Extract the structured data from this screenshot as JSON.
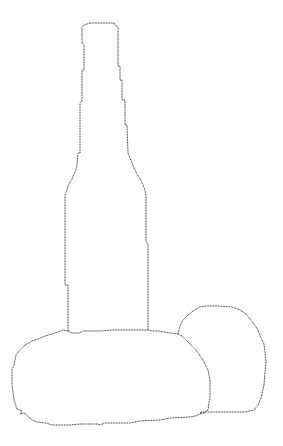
{
  "drawing": {
    "description": "Line drawing of a bottle standing behind a rounded loaf shape with a ball to its right",
    "objects": [
      "bottle",
      "oval-loaf",
      "ball"
    ],
    "stroke_color": "#3a3a3a",
    "background_color": "#ffffff"
  }
}
